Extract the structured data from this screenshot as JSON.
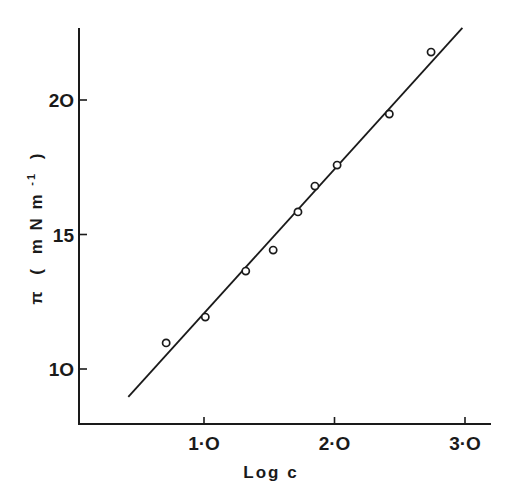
{
  "chart_data": {
    "type": "scatter",
    "title": "",
    "xlabel": "Log c",
    "ylabel": "π ( m N m⁻¹ )",
    "ylabel_parts": {
      "symbol": "π",
      "open": "(",
      "units": "m N m",
      "sup": "-1",
      "close": ")"
    },
    "xlim": [
      0.0,
      3.2
    ],
    "ylim": [
      8.0,
      22.6
    ],
    "grid": false,
    "legend": null,
    "x_ticks": [
      1.0,
      2.0,
      3.0
    ],
    "x_tick_labels": [
      "1·O",
      "2·O",
      "3·O"
    ],
    "y_ticks": [
      10,
      15,
      20
    ],
    "y_tick_labels": [
      "1O",
      "15",
      "2O"
    ],
    "series": [
      {
        "name": "data",
        "marker": "open-circle",
        "x": [
          0.71,
          1.01,
          1.32,
          1.53,
          1.72,
          1.85,
          2.02,
          2.42,
          2.74
        ],
        "y": [
          10.97,
          11.93,
          13.64,
          14.42,
          15.84,
          16.8,
          17.58,
          19.48,
          21.78
        ]
      },
      {
        "name": "linear fit",
        "marker": "line",
        "x": [
          0.42,
          2.98
        ],
        "y": [
          8.96,
          22.68
        ]
      }
    ]
  },
  "colors": {
    "ink": "#1a1a1a",
    "background": "#ffffff"
  }
}
